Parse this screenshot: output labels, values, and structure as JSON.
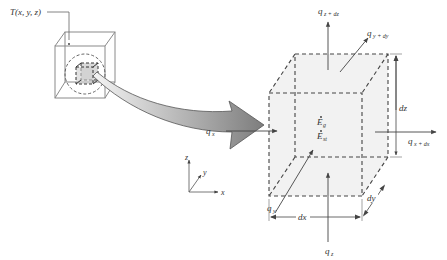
{
  "figure": {
    "type": "differential control volume for heat conduction",
    "colors": {
      "line": "#555555",
      "dashed_edge": "#444444",
      "face_fill": "#f0f0f0",
      "arrow_fill_dark": "#888888",
      "arrow_fill_light": "#f2f2f2",
      "text": "#333333"
    }
  },
  "small_cube": {
    "point_label": "T(x, y, z)"
  },
  "axes": {
    "x": "x",
    "y": "y",
    "z": "z"
  },
  "control_volume": {
    "energy_generated": {
      "base": "E",
      "sub": "g"
    },
    "energy_stored": {
      "base": "E",
      "sub": "st"
    }
  },
  "fluxes": {
    "qx": {
      "base": "q",
      "sub": "x"
    },
    "qx_dx": {
      "base": "q",
      "sub": "x + dx"
    },
    "qy": {
      "base": "q",
      "sub": "y"
    },
    "qy_dy": {
      "base": "q",
      "sub": "y + dy"
    },
    "qz": {
      "base": "q",
      "sub": "z"
    },
    "qz_dz": {
      "base": "q",
      "sub": "z + dz"
    }
  },
  "dimensions": {
    "dx": "dx",
    "dy": "dy",
    "dz": "dz"
  }
}
